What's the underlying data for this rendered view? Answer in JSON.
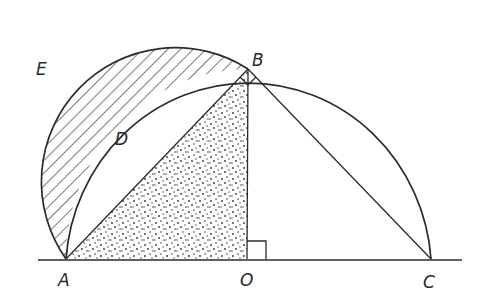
{
  "figure": {
    "colors": {
      "ink": "#2b2b2b",
      "background": "#ffffff"
    },
    "points": {
      "A": {
        "label": "A",
        "x": 66,
        "y": 259
      },
      "B": {
        "label": "B",
        "x": 248,
        "y": 69
      },
      "C": {
        "label": "C",
        "x": 431,
        "y": 259
      },
      "O": {
        "label": "O",
        "x": 247,
        "y": 259
      },
      "D": {
        "label": "D"
      },
      "E": {
        "label": "E"
      }
    },
    "labels": {
      "A": "A",
      "B": "B",
      "C": "C",
      "O": "O",
      "D": "D",
      "E": "E"
    },
    "regions": {
      "lune": {
        "name": "lune AEB",
        "fill": "diagonal-hatch"
      },
      "triangle": {
        "name": "triangle AOB",
        "fill": "stipple"
      }
    },
    "right_angle_marks": [
      "angle ABC at B",
      "angle AOB at O"
    ]
  }
}
